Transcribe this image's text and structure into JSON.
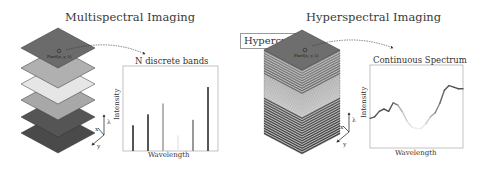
{
  "left_panel": {
    "title": "Multispectral Imaging",
    "pixel_label": "Pixel(x, y, λ)",
    "layer_colors": [
      "#6b6b6b",
      "#b0b0b0",
      "#e6e6e6",
      "#a8a8a8",
      "#555555",
      "#4a4a4a"
    ],
    "axes": {
      "x": "x",
      "y": "y",
      "z": "λ"
    },
    "chart": {
      "title": "N discrete bands",
      "xlabel": "Wavelength",
      "ylabel": "Intensity"
    }
  },
  "right_panel": {
    "title": "Hyperspectral Imaging",
    "box_label": "Hypercube",
    "pixel_label": "Pixel(x, y, λ)",
    "axes": {
      "x": "x",
      "y": "y",
      "z": "λ"
    },
    "chart": {
      "title": "Continuous Spectrum",
      "xlabel": "Wavelength",
      "ylabel": "Intensity"
    }
  },
  "chart_data": [
    {
      "type": "bar",
      "title": "N discrete bands",
      "xlabel": "Wavelength",
      "ylabel": "Intensity",
      "categories": [
        "b1",
        "b2",
        "b3",
        "b4",
        "b5",
        "b6"
      ],
      "values": [
        0.33,
        0.47,
        0.61,
        0.2,
        0.4,
        0.82
      ],
      "colors": [
        "#555555",
        "#555555",
        "#b5b5b5",
        "#eeeeee",
        "#999999",
        "#555555"
      ],
      "ylim": [
        0,
        1
      ]
    },
    {
      "type": "line",
      "title": "Continuous Spectrum",
      "xlabel": "Wavelength",
      "ylabel": "Intensity",
      "x": [
        0,
        0.05,
        0.1,
        0.15,
        0.2,
        0.25,
        0.3,
        0.35,
        0.4,
        0.45,
        0.5,
        0.55,
        0.6,
        0.65,
        0.7,
        0.75,
        0.8,
        0.85,
        0.9,
        0.95,
        1.0
      ],
      "y": [
        0.38,
        0.4,
        0.47,
        0.5,
        0.47,
        0.58,
        0.55,
        0.46,
        0.34,
        0.27,
        0.25,
        0.25,
        0.31,
        0.4,
        0.45,
        0.57,
        0.74,
        0.8,
        0.78,
        0.76,
        0.76
      ],
      "colors": [
        "#555555",
        "#555555",
        "#555555",
        "#555555",
        "#555555",
        "#777777",
        "#aaaaaa",
        "#cccccc",
        "#e0e0e0",
        "#ececec",
        "#eeeeee",
        "#e8e8e8",
        "#cccccc",
        "#aaaaaa",
        "#888888",
        "#666666",
        "#555555",
        "#555555",
        "#555555",
        "#555555"
      ],
      "ylim": [
        0,
        1
      ]
    }
  ]
}
